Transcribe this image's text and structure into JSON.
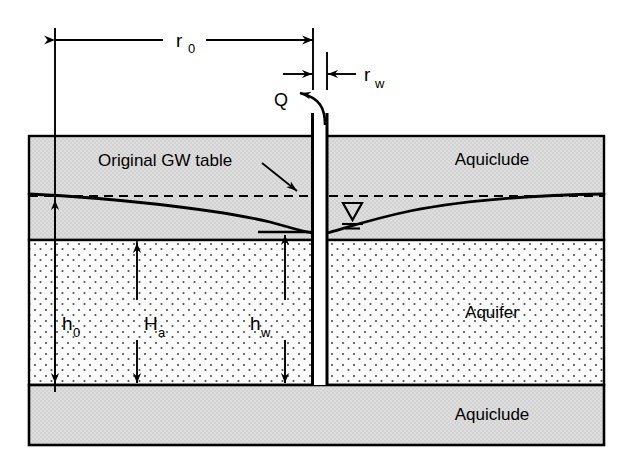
{
  "figure": {
    "type": "cross-section-diagram",
    "background_color": "#ffffff"
  },
  "colors": {
    "line": "#000000",
    "aquiclude_fill": "#d9d9d9",
    "aquifer_fill": "#fbfbfb",
    "aquifer_dot": "#4d4d4d",
    "well_fill": "#ffffff",
    "background": "#ffffff"
  },
  "layers": [
    {
      "id": "upper-aquiclude",
      "label": "Aquiclude",
      "fill": "#d9d9d9",
      "top": 136,
      "bottom": 240,
      "label_x": 492,
      "label_y": 165
    },
    {
      "id": "aquifer",
      "label": "Aquifer",
      "fill": "#fbfbfb",
      "top": 240,
      "bottom": 385,
      "label_x": 492,
      "label_y": 318
    },
    {
      "id": "lower-aquiclude",
      "label": "Aquiclude",
      "fill": "#d9d9d9",
      "top": 385,
      "bottom": 445,
      "label_x": 492,
      "label_y": 420
    }
  ],
  "annotations": {
    "original_gw_table": "Original GW table",
    "discharge": "Q"
  },
  "dimensions": {
    "horizontal": [
      {
        "id": "r0",
        "base": "r",
        "subscript": "0",
        "y": 40,
        "x_start": 55,
        "x_end": 313,
        "label_x": 184,
        "label_y": 40
      },
      {
        "id": "rw",
        "base": "r",
        "subscript": "w",
        "y": 74,
        "x_start": 290,
        "x_end": 350,
        "label_x": 366,
        "label_y": 74
      }
    ],
    "vertical": [
      {
        "id": "h0",
        "base": "h",
        "subscript": "0",
        "x": 55,
        "y_top": 196,
        "y_bottom": 385,
        "label_x": 66,
        "label_y": 323
      },
      {
        "id": "Ha",
        "base": "H",
        "subscript": "a",
        "x": 137,
        "y_top": 240,
        "y_bottom": 385,
        "label_x": 148,
        "label_y": 323
      },
      {
        "id": "hw",
        "base": "h",
        "subscript": "w",
        "x": 285,
        "y_top": 232,
        "y_bottom": 385,
        "label_x": 260,
        "label_y": 323
      }
    ]
  },
  "well": {
    "left_wall_x": 312,
    "right_wall_x": 327,
    "top_y": 113,
    "bottom_y": 385
  },
  "water_table": {
    "static_level_y": 196,
    "drawdown_level_at_well_y": 232,
    "symbol_x": 352,
    "symbol_y": 212
  }
}
